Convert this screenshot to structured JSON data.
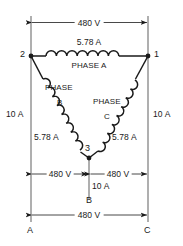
{
  "diagram": {
    "type": "electrical-schematic",
    "line_color": "#1a1a1a",
    "background": "#ffffff",
    "dimensions": {
      "top_voltage": "480 V",
      "bottom_left_voltage": "480 V",
      "bottom_right_voltage": "480 V",
      "bottom_total_voltage": "480 V"
    },
    "currents": {
      "phase_a_current": "5.78 A",
      "phase_b_current": "5.78 A",
      "phase_c_current": "5.78 A",
      "line_a_current": "10 A",
      "line_b_current": "10 A",
      "line_c_current": "10 A"
    },
    "windings": [
      {
        "id": "phase-a",
        "label_line1": "PHASE A",
        "label_line2": "",
        "current": "5.78 A"
      },
      {
        "id": "phase-b",
        "label_line1": "PHASE",
        "label_line2": "B",
        "current": "5.78 A"
      },
      {
        "id": "phase-c",
        "label_line1": "PHASE",
        "label_line2": "C",
        "current": "5.78 A"
      }
    ],
    "nodes": [
      {
        "id": "node-1",
        "label": "1"
      },
      {
        "id": "node-2",
        "label": "2"
      },
      {
        "id": "node-3",
        "label": "3"
      }
    ],
    "terminals": [
      {
        "id": "terminal-a",
        "label": "A"
      },
      {
        "id": "terminal-b",
        "label": "B"
      },
      {
        "id": "terminal-c",
        "label": "C"
      }
    ]
  }
}
